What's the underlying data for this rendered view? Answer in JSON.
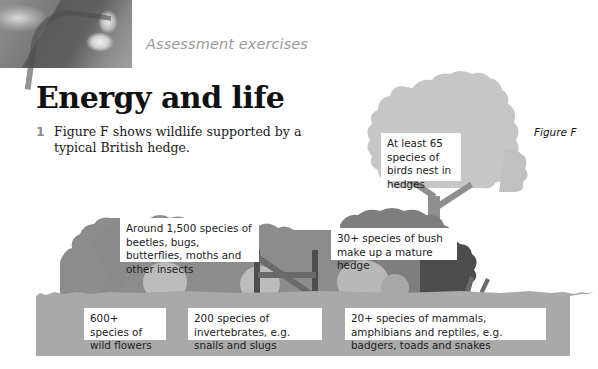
{
  "header": {
    "section_label": "Assessment exercises",
    "photo_icon": "photo-thumbnail"
  },
  "page": {
    "title": "Energy and life"
  },
  "question": {
    "number": "1",
    "text": "Figure F shows wildlife supported by a typical British hedge."
  },
  "figure": {
    "label": "Figure F",
    "colors": {
      "tree_light": "#c4c4c4",
      "tree_trunk": "#8e8e8e",
      "hedge_mid": "#8a8a8a",
      "hedge_dark": "#6e6e6e",
      "hedge_darkest": "#4a4a4a",
      "bush_light": "#b8b8b8",
      "ground": "#a9a9a9",
      "callout_bg": "#ffffff"
    },
    "callouts": {
      "birds": "At least 65 species of birds nest in hedges",
      "insects": "Around 1,500 species of beetles, bugs, butterflies, moths and other insects",
      "bush": "30+ species of bush make up a mature hedge",
      "flowers": "600+ species of wild flowers",
      "invertebrates": "200 species of invertebrates, e.g. snails and slugs",
      "mammals": "20+ species of mammals, amphibians and reptiles, e.g. badgers, toads and snakes"
    }
  }
}
